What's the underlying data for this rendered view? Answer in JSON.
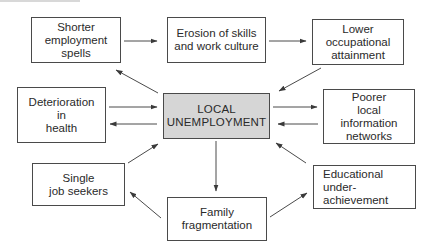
{
  "diagram": {
    "central": {
      "id": "local-unemployment",
      "label": "LOCAL\nUNEMPLOYMENT",
      "fill": "#d6d6d6"
    },
    "nodes": [
      {
        "id": "shorter-employment-spells",
        "label": "Shorter\nemployment\nspells"
      },
      {
        "id": "erosion-of-skills",
        "label": "Erosion of skills\nand work culture"
      },
      {
        "id": "lower-occupational-attainment",
        "label": "Lower\noccupational\nattainment"
      },
      {
        "id": "deterioration-in-health",
        "label": "Deterioration\nin\nhealth"
      },
      {
        "id": "poorer-local-information-networks",
        "label": "Poorer\nlocal\ninformation\nnetworks"
      },
      {
        "id": "single-job-seekers",
        "label": "Single\njob seekers"
      },
      {
        "id": "family-fragmentation",
        "label": "Family\nfragmentation"
      },
      {
        "id": "educational-under-achievement",
        "label": "Educational\nunder-\nachievement"
      }
    ],
    "edges": [
      {
        "from": "shorter-employment-spells",
        "to": "erosion-of-skills"
      },
      {
        "from": "erosion-of-skills",
        "to": "lower-occupational-attainment"
      },
      {
        "from": "lower-occupational-attainment",
        "to": "local-unemployment"
      },
      {
        "from": "local-unemployment",
        "to": "shorter-employment-spells"
      },
      {
        "from": "deterioration-in-health",
        "to": "local-unemployment"
      },
      {
        "from": "local-unemployment",
        "to": "deterioration-in-health"
      },
      {
        "from": "local-unemployment",
        "to": "poorer-local-information-networks"
      },
      {
        "from": "poorer-local-information-networks",
        "to": "local-unemployment"
      },
      {
        "from": "single-job-seekers",
        "to": "local-unemployment"
      },
      {
        "from": "family-fragmentation",
        "to": "single-job-seekers"
      },
      {
        "from": "local-unemployment",
        "to": "family-fragmentation"
      },
      {
        "from": "family-fragmentation",
        "to": "educational-under-achievement"
      },
      {
        "from": "educational-under-achievement",
        "to": "local-unemployment"
      }
    ]
  }
}
